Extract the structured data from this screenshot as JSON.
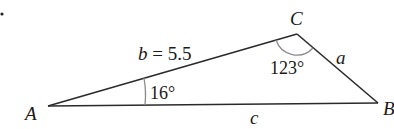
{
  "diagram": {
    "type": "triangle",
    "vertices": {
      "A": {
        "label": "A"
      },
      "B": {
        "label": "B"
      },
      "C": {
        "label": "C"
      }
    },
    "sides": {
      "b": {
        "label": "b = 5.5",
        "var": "b",
        "value": "5.5"
      },
      "a": {
        "label": "a"
      },
      "c": {
        "label": "c"
      }
    },
    "angles": {
      "A": {
        "label": "16°"
      },
      "C": {
        "label": "123°"
      }
    },
    "colors": {
      "line": "#2a2a2a",
      "arc": "#8a8a8a"
    }
  }
}
